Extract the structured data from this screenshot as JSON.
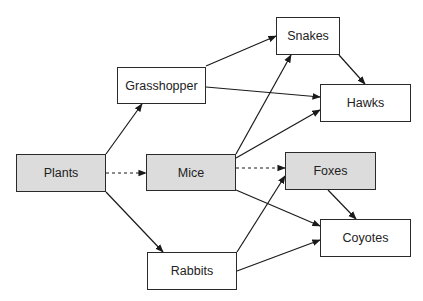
{
  "diagram": {
    "nodes": [
      {
        "id": "plants",
        "label": "Plants",
        "shaded": true,
        "x": 16,
        "y": 154,
        "w": 90,
        "h": 38
      },
      {
        "id": "grasshopper",
        "label": "Grasshopper",
        "shaded": false,
        "x": 117,
        "y": 67,
        "w": 89,
        "h": 37
      },
      {
        "id": "mice",
        "label": "Mice",
        "shaded": true,
        "x": 146,
        "y": 154,
        "w": 90,
        "h": 37
      },
      {
        "id": "rabbits",
        "label": "Rabbits",
        "shaded": false,
        "x": 147,
        "y": 252,
        "w": 90,
        "h": 38
      },
      {
        "id": "snakes",
        "label": "Snakes",
        "shaded": false,
        "x": 276,
        "y": 17,
        "w": 64,
        "h": 38
      },
      {
        "id": "hawks",
        "label": "Hawks",
        "shaded": false,
        "x": 320,
        "y": 84,
        "w": 91,
        "h": 38
      },
      {
        "id": "foxes",
        "label": "Foxes",
        "shaded": true,
        "x": 285,
        "y": 152,
        "w": 91,
        "h": 38
      },
      {
        "id": "coyotes",
        "label": "Coyotes",
        "shaded": false,
        "x": 320,
        "y": 219,
        "w": 91,
        "h": 38
      }
    ],
    "edges": [
      {
        "from": "plants",
        "to": "grasshopper",
        "style": "solid",
        "x1": 106,
        "y1": 154,
        "x2": 142,
        "y2": 104
      },
      {
        "from": "plants",
        "to": "mice",
        "style": "dashed",
        "x1": 106,
        "y1": 173,
        "x2": 146,
        "y2": 173
      },
      {
        "from": "plants",
        "to": "rabbits",
        "style": "solid",
        "x1": 106,
        "y1": 192,
        "x2": 163,
        "y2": 252
      },
      {
        "from": "grasshopper",
        "to": "snakes",
        "style": "solid",
        "x1": 206,
        "y1": 66,
        "x2": 276,
        "y2": 36
      },
      {
        "from": "grasshopper",
        "to": "hawks",
        "style": "solid",
        "x1": 206,
        "y1": 87,
        "x2": 320,
        "y2": 97
      },
      {
        "from": "mice",
        "to": "snakes",
        "style": "solid",
        "x1": 236,
        "y1": 154,
        "x2": 291,
        "y2": 55
      },
      {
        "from": "mice",
        "to": "hawks",
        "style": "solid",
        "x1": 236,
        "y1": 158,
        "x2": 320,
        "y2": 110
      },
      {
        "from": "mice",
        "to": "foxes",
        "style": "dashed",
        "x1": 236,
        "y1": 168,
        "x2": 285,
        "y2": 168
      },
      {
        "from": "mice",
        "to": "coyotes",
        "style": "solid",
        "x1": 236,
        "y1": 190,
        "x2": 320,
        "y2": 226
      },
      {
        "from": "rabbits",
        "to": "foxes",
        "style": "solid",
        "x1": 237,
        "y1": 252,
        "x2": 285,
        "y2": 176
      },
      {
        "from": "rabbits",
        "to": "coyotes",
        "style": "solid",
        "x1": 237,
        "y1": 271,
        "x2": 320,
        "y2": 240
      },
      {
        "from": "snakes",
        "to": "hawks",
        "style": "solid",
        "x1": 339,
        "y1": 55,
        "x2": 365,
        "y2": 84
      },
      {
        "from": "foxes",
        "to": "coyotes",
        "style": "solid",
        "x1": 328,
        "y1": 190,
        "x2": 356,
        "y2": 219
      }
    ]
  }
}
